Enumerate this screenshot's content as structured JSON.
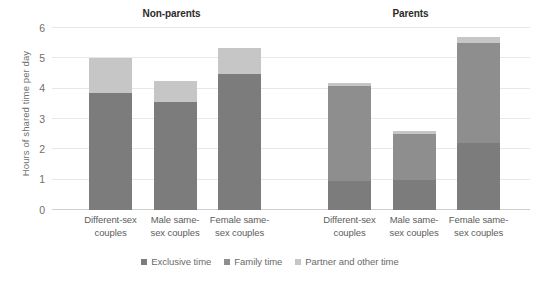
{
  "chart_data": {
    "type": "bar",
    "subtype": "stacked-bar",
    "title": "",
    "xlabel": "",
    "ylabel": "Hours of shared time per day",
    "ylim": [
      0,
      6
    ],
    "yticks": [
      0,
      1,
      2,
      3,
      4,
      5,
      6
    ],
    "ytick_labels": [
      "0",
      "1",
      "2",
      "3",
      "4",
      "5",
      "6"
    ],
    "grid": true,
    "legend_position": "bottom",
    "panels": [
      {
        "title": "Non-parents",
        "categories": [
          "Different-sex couples",
          "Male same-sex couples",
          "Female same-sex couples"
        ],
        "series": [
          {
            "name": "Exclusive time",
            "values": [
              3.85,
              3.55,
              4.5
            ]
          },
          {
            "name": "Family time",
            "values": [
              0,
              0,
              0
            ]
          },
          {
            "name": "Partner and other time",
            "values": [
              1.15,
              0.7,
              0.85
            ]
          }
        ],
        "totals": [
          5.0,
          4.25,
          5.35
        ]
      },
      {
        "title": "Parents",
        "categories": [
          "Different-sex couples",
          "Male same-sex couples",
          "Female same-sex couples"
        ],
        "series": [
          {
            "name": "Exclusive time",
            "values": [
              0.95,
              1.0,
              2.2
            ]
          },
          {
            "name": "Family time",
            "values": [
              3.15,
              1.5,
              3.3
            ]
          },
          {
            "name": "Partner and other time",
            "values": [
              0.1,
              0.1,
              0.2
            ]
          }
        ],
        "totals": [
          4.2,
          2.6,
          5.7
        ]
      }
    ],
    "legend": [
      {
        "label": "Exclusive time",
        "color": "#7c7c7c"
      },
      {
        "label": "Family time",
        "color": "#8e8e8e"
      },
      {
        "label": "Partner and other time",
        "color": "#c6c6c6"
      }
    ],
    "colors": {
      "exclusive_time": "#7c7c7c",
      "family_time": "#8e8e8e",
      "partner_and_other_time": "#c6c6c6",
      "gridline": "#e8e8e8",
      "axis": "#cfcfcf",
      "text": "#6a6a6a",
      "panel_title_text": "#2b2b2b"
    }
  },
  "axis": {
    "y_title": "Hours of shared time per day"
  }
}
